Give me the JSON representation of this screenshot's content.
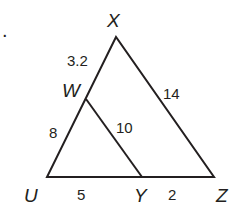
{
  "diagram": {
    "bullet": ".",
    "points": {
      "X": {
        "label": "X",
        "x": 116,
        "y": 37
      },
      "W": {
        "label": "W",
        "x": 86,
        "y": 99
      },
      "U": {
        "label": "U",
        "x": 47,
        "y": 177
      },
      "Y": {
        "label": "Y",
        "x": 142,
        "y": 177
      },
      "Z": {
        "label": "Z",
        "x": 214,
        "y": 177
      }
    },
    "segments": [
      {
        "from": "X",
        "to": "W",
        "length": "3.2"
      },
      {
        "from": "W",
        "to": "U",
        "length": "8"
      },
      {
        "from": "X",
        "to": "Z",
        "length": "14"
      },
      {
        "from": "W",
        "to": "Y",
        "length": "10"
      },
      {
        "from": "U",
        "to": "Y",
        "length": "5"
      },
      {
        "from": "Y",
        "to": "Z",
        "length": "2"
      }
    ],
    "stroke_color": "#231f20"
  }
}
